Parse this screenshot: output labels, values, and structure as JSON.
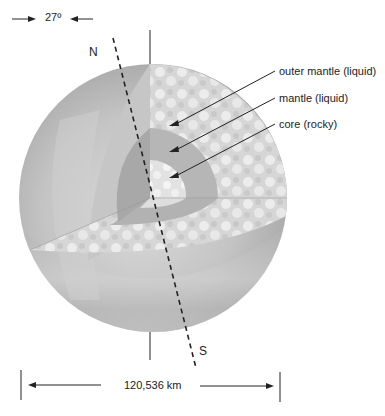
{
  "diagram": {
    "tilt_label": "27º",
    "north_label": "N",
    "south_label": "S",
    "diameter_label": "120,536 km",
    "layers": [
      {
        "label": "outer mantle (liquid)"
      },
      {
        "label": "mantle (liquid)"
      },
      {
        "label": "core (rocky)"
      }
    ],
    "colors": {
      "sphere_shadow": "#a8a8a8",
      "sphere_light": "#d4d4d4",
      "outer_mantle": "#dcdcdc",
      "mantle": "#b8b8b8",
      "core": "#e6e6e6",
      "lines": "#222222"
    }
  }
}
